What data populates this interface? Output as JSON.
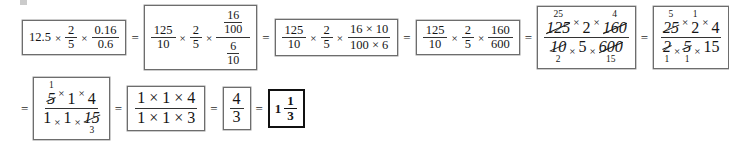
{
  "document": {
    "type": "worked-arithmetic-solution",
    "description": "Step-by-step simplification of 12.5 x 2/5 x 0.16/0.6",
    "operator_times": "×",
    "operator_equals": "="
  },
  "steps": [
    {
      "id": "step-1",
      "kind": "decimal-product",
      "row": 1,
      "parts": [
        {
          "type": "scalar",
          "value": "12.5"
        },
        {
          "type": "fraction",
          "numerator": "2",
          "denominator": "5"
        },
        {
          "type": "fraction",
          "numerator": "0.16",
          "denominator": "0.6"
        }
      ]
    },
    {
      "id": "step-2",
      "kind": "complex-fraction",
      "row": 1,
      "parts": [
        {
          "type": "fraction",
          "numerator": "125",
          "denominator": "10"
        },
        {
          "type": "fraction",
          "numerator": "2",
          "denominator": "5"
        },
        {
          "type": "complex-fraction",
          "numerator": {
            "numerator": "16",
            "denominator": "100"
          },
          "denominator": {
            "numerator": "6",
            "denominator": "10"
          }
        }
      ]
    },
    {
      "id": "step-3",
      "kind": "product-fraction",
      "row": 1,
      "parts": [
        {
          "type": "fraction",
          "numerator": "125",
          "denominator": "10"
        },
        {
          "type": "fraction",
          "numerator": "2",
          "denominator": "5"
        },
        {
          "type": "fraction",
          "numerator": "16 × 10",
          "denominator": "100 × 6"
        }
      ]
    },
    {
      "id": "step-4",
      "kind": "product-fraction",
      "row": 1,
      "parts": [
        {
          "type": "fraction",
          "numerator": "125",
          "denominator": "10"
        },
        {
          "type": "fraction",
          "numerator": "2",
          "denominator": "5"
        },
        {
          "type": "fraction",
          "numerator": "160",
          "denominator": "600"
        }
      ]
    },
    {
      "id": "step-5",
      "kind": "cancellation",
      "row": 1,
      "numerator_factors": [
        {
          "value": "125",
          "struck": true,
          "above": "25",
          "below": ""
        },
        {
          "value": "2",
          "struck": false,
          "above": "",
          "below": ""
        },
        {
          "value": "160",
          "struck": true,
          "above": "4",
          "below": ""
        }
      ],
      "denominator_factors": [
        {
          "value": "10",
          "struck": true,
          "above": "",
          "below": "2"
        },
        {
          "value": "5",
          "struck": false,
          "above": "",
          "below": ""
        },
        {
          "value": "600",
          "struck": true,
          "above": "",
          "below": "15"
        }
      ]
    },
    {
      "id": "step-6",
      "kind": "cancellation",
      "row": 1,
      "numerator_factors": [
        {
          "value": "25",
          "struck": true,
          "above": "5",
          "below": ""
        },
        {
          "value": "2",
          "struck": false,
          "above": "1",
          "below": ""
        },
        {
          "value": "4",
          "struck": false,
          "above": "",
          "below": ""
        }
      ],
      "denominator_factors": [
        {
          "value": "2",
          "struck": true,
          "above": "",
          "below": "1"
        },
        {
          "value": "5",
          "struck": true,
          "above": "",
          "below": "1"
        },
        {
          "value": "15",
          "struck": false,
          "above": "",
          "below": ""
        }
      ]
    },
    {
      "id": "step-7",
      "kind": "cancellation",
      "row": 2,
      "numerator_factors": [
        {
          "value": "5",
          "struck": true,
          "above": "1",
          "below": ""
        },
        {
          "value": "1",
          "struck": false,
          "above": "",
          "below": ""
        },
        {
          "value": "4",
          "struck": false,
          "above": "",
          "below": ""
        }
      ],
      "denominator_factors": [
        {
          "value": "1",
          "struck": false,
          "above": "",
          "below": ""
        },
        {
          "value": "1",
          "struck": false,
          "above": "",
          "below": ""
        },
        {
          "value": "15",
          "struck": true,
          "above": "",
          "below": "3"
        }
      ]
    },
    {
      "id": "step-8",
      "kind": "product-fraction",
      "row": 2,
      "parts": [
        {
          "type": "fraction",
          "numerator": "1 × 1 × 4",
          "denominator": "1 × 1 × 3"
        }
      ]
    },
    {
      "id": "step-9",
      "kind": "simple-fraction",
      "row": 2,
      "parts": [
        {
          "type": "fraction",
          "numerator": "4",
          "denominator": "3"
        }
      ]
    },
    {
      "id": "step-10",
      "kind": "mixed-number-answer",
      "row": 2,
      "whole": "1",
      "numerator": "1",
      "denominator": "3"
    }
  ]
}
